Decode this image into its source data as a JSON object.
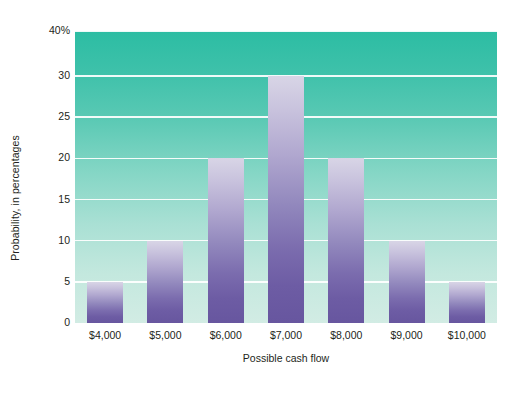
{
  "chart_data": {
    "type": "bar",
    "title": "",
    "xlabel": "Possible cash flow",
    "ylabel": "Probability, in percentages",
    "categories": [
      "$4,000",
      "$5,000",
      "$6,000",
      "$7,000",
      "$8,000",
      "$9,000",
      "$10,000"
    ],
    "values": [
      5,
      10,
      20,
      30,
      20,
      10,
      5
    ],
    "ylim": [
      0,
      40
    ],
    "ytick_labels": [
      "40%",
      "30",
      "25",
      "20",
      "15",
      "10",
      "5",
      "0"
    ],
    "ytick_values": [
      40,
      30,
      25,
      20,
      15,
      10,
      5,
      0
    ],
    "grid": true,
    "legend": "none",
    "colors": {
      "plot_background_top": "#2cbda3",
      "plot_background_bottom": "#d2ece4",
      "bar_top": "#d8d5e6",
      "bar_bottom": "#67569f",
      "gridline": "#ffffff",
      "text": "#231f20",
      "page_background": "#ffffff"
    }
  }
}
